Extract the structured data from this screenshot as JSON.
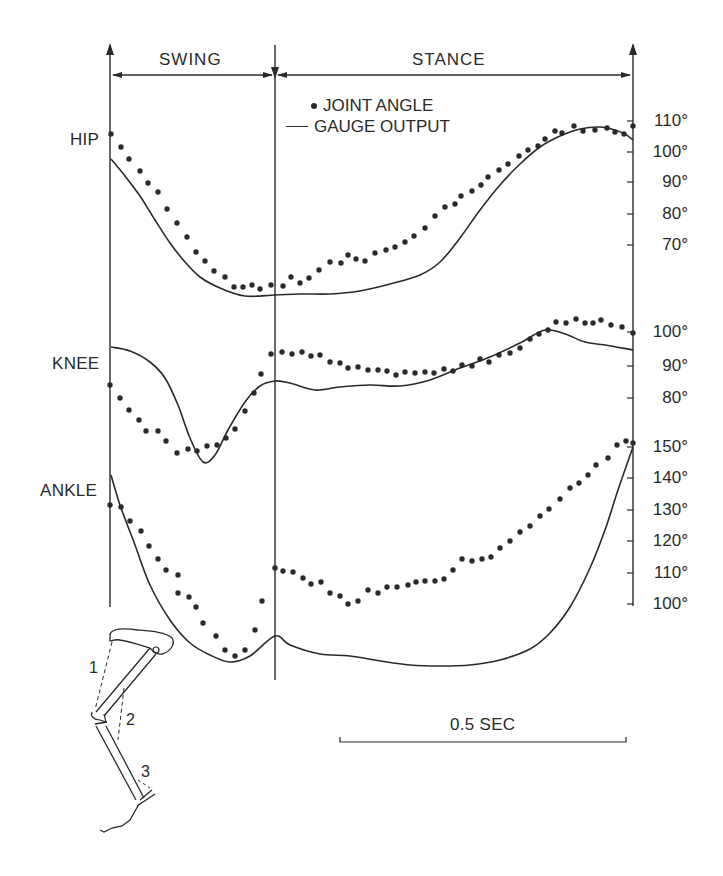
{
  "chart_data": {
    "type": "line",
    "title": "",
    "phases": [
      {
        "label": "SWING",
        "x_start_px": 110,
        "x_end_px": 275
      },
      {
        "label": "STANCE",
        "x_start_px": 275,
        "x_end_px": 633
      }
    ],
    "legend": [
      {
        "marker": "dot",
        "label": "JOINT ANGLE"
      },
      {
        "marker": "line",
        "label": "GAUGE OUTPUT"
      }
    ],
    "time_scale": {
      "label": "0.5 SEC",
      "x1_px": 340,
      "x2_px": 626,
      "y_px": 742
    },
    "panels": [
      {
        "name": "HIP",
        "unit": "degrees",
        "ticks": [
          {
            "label": "110°",
            "value": 110,
            "y_px": 121
          },
          {
            "label": "100°",
            "value": 100,
            "y_px": 152
          },
          {
            "label": "90°",
            "value": 90,
            "y_px": 182
          },
          {
            "label": "80°",
            "value": 80,
            "y_px": 214
          },
          {
            "label": "70°",
            "value": 70,
            "y_px": 245
          }
        ],
        "joint_angle_points_px": [
          [
            111,
            134
          ],
          [
            121,
            147
          ],
          [
            129,
            159
          ],
          [
            140,
            171
          ],
          [
            148,
            183
          ],
          [
            158,
            192
          ],
          [
            167,
            209
          ],
          [
            177,
            223
          ],
          [
            187,
            237
          ],
          [
            196,
            252
          ],
          [
            205,
            261
          ],
          [
            214,
            271
          ],
          [
            225,
            277
          ],
          [
            234,
            287
          ],
          [
            243,
            287
          ],
          [
            252,
            285
          ],
          [
            260,
            289
          ],
          [
            271,
            285
          ],
          [
            283,
            286
          ],
          [
            291,
            277
          ],
          [
            300,
            283
          ],
          [
            309,
            278
          ],
          [
            319,
            270
          ],
          [
            330,
            262
          ],
          [
            341,
            263
          ],
          [
            348,
            255
          ],
          [
            356,
            259
          ],
          [
            365,
            261
          ],
          [
            375,
            253
          ],
          [
            386,
            250
          ],
          [
            395,
            247
          ],
          [
            405,
            242
          ],
          [
            414,
            236
          ],
          [
            425,
            228
          ],
          [
            435,
            216
          ],
          [
            445,
            207
          ],
          [
            455,
            204
          ],
          [
            461,
            196
          ],
          [
            472,
            191
          ],
          [
            481,
            185
          ],
          [
            488,
            177
          ],
          [
            499,
            170
          ],
          [
            508,
            164
          ],
          [
            519,
            156
          ],
          [
            528,
            150
          ],
          [
            538,
            146
          ],
          [
            545,
            139
          ],
          [
            555,
            131
          ],
          [
            562,
            133
          ],
          [
            574,
            126
          ],
          [
            583,
            131
          ],
          [
            595,
            130
          ],
          [
            607,
            128
          ],
          [
            615,
            132
          ],
          [
            624,
            134
          ],
          [
            633,
            126
          ]
        ],
        "gauge_output_path_px": [
          [
            111,
            159
          ],
          [
            125,
            176
          ],
          [
            140,
            196
          ],
          [
            155,
            220
          ],
          [
            170,
            243
          ],
          [
            185,
            262
          ],
          [
            200,
            277
          ],
          [
            220,
            288
          ],
          [
            245,
            296
          ],
          [
            275,
            295
          ],
          [
            300,
            294
          ],
          [
            330,
            294
          ],
          [
            360,
            291
          ],
          [
            390,
            284
          ],
          [
            420,
            275
          ],
          [
            440,
            262
          ],
          [
            460,
            238
          ],
          [
            480,
            210
          ],
          [
            500,
            185
          ],
          [
            520,
            164
          ],
          [
            540,
            147
          ],
          [
            560,
            136
          ],
          [
            580,
            129
          ],
          [
            600,
            127
          ],
          [
            615,
            130
          ],
          [
            625,
            134
          ],
          [
            633,
            140
          ]
        ]
      },
      {
        "name": "KNEE",
        "unit": "degrees",
        "ticks": [
          {
            "label": "100°",
            "value": 100,
            "y_px": 332
          },
          {
            "label": "90°",
            "value": 90,
            "y_px": 366
          },
          {
            "label": "80°",
            "value": 80,
            "y_px": 398
          }
        ],
        "joint_angle_points_px": [
          [
            110,
            385
          ],
          [
            120,
            398
          ],
          [
            129,
            410
          ],
          [
            139,
            420
          ],
          [
            146,
            431
          ],
          [
            158,
            431
          ],
          [
            166,
            441
          ],
          [
            177,
            453
          ],
          [
            188,
            449
          ],
          [
            197,
            451
          ],
          [
            207,
            446
          ],
          [
            217,
            445
          ],
          [
            226,
            438
          ],
          [
            235,
            429
          ],
          [
            245,
            411
          ],
          [
            254,
            393
          ],
          [
            261,
            374
          ],
          [
            271,
            354
          ],
          [
            282,
            352
          ],
          [
            292,
            354
          ],
          [
            302,
            352
          ],
          [
            311,
            356
          ],
          [
            320,
            355
          ],
          [
            330,
            362
          ],
          [
            340,
            363
          ],
          [
            348,
            368
          ],
          [
            358,
            367
          ],
          [
            368,
            370
          ],
          [
            378,
            370
          ],
          [
            387,
            371
          ],
          [
            396,
            375
          ],
          [
            405,
            372
          ],
          [
            415,
            373
          ],
          [
            425,
            372
          ],
          [
            434,
            373
          ],
          [
            444,
            369
          ],
          [
            453,
            371
          ],
          [
            462,
            365
          ],
          [
            472,
            366
          ],
          [
            480,
            359
          ],
          [
            489,
            362
          ],
          [
            499,
            355
          ],
          [
            510,
            353
          ],
          [
            520,
            348
          ],
          [
            530,
            339
          ],
          [
            539,
            334
          ],
          [
            548,
            330
          ],
          [
            556,
            322
          ],
          [
            566,
            323
          ],
          [
            576,
            319
          ],
          [
            585,
            323
          ],
          [
            593,
            323
          ],
          [
            601,
            320
          ],
          [
            611,
            325
          ],
          [
            622,
            327
          ],
          [
            633,
            333
          ]
        ],
        "gauge_output_path_px": [
          [
            111,
            347
          ],
          [
            130,
            351
          ],
          [
            150,
            362
          ],
          [
            165,
            378
          ],
          [
            178,
            405
          ],
          [
            190,
            438
          ],
          [
            203,
            462
          ],
          [
            215,
            455
          ],
          [
            228,
            430
          ],
          [
            245,
            402
          ],
          [
            260,
            386
          ],
          [
            275,
            381
          ],
          [
            290,
            383
          ],
          [
            315,
            390
          ],
          [
            340,
            387
          ],
          [
            370,
            385
          ],
          [
            400,
            386
          ],
          [
            430,
            380
          ],
          [
            460,
            368
          ],
          [
            490,
            357
          ],
          [
            520,
            343
          ],
          [
            545,
            330
          ],
          [
            565,
            334
          ],
          [
            585,
            342
          ],
          [
            605,
            345
          ],
          [
            633,
            350
          ]
        ]
      },
      {
        "name": "ANKLE",
        "unit": "degrees",
        "ticks": [
          {
            "label": "150°",
            "value": 150,
            "y_px": 447
          },
          {
            "label": "140°",
            "value": 140,
            "y_px": 478
          },
          {
            "label": "130°",
            "value": 130,
            "y_px": 510
          },
          {
            "label": "120°",
            "value": 120,
            "y_px": 541
          },
          {
            "label": "110°",
            "value": 110,
            "y_px": 573
          },
          {
            "label": "100°",
            "value": 100,
            "y_px": 604
          }
        ],
        "joint_angle_points_px": [
          [
            110,
            505
          ],
          [
            121,
            507
          ],
          [
            130,
            521
          ],
          [
            141,
            531
          ],
          [
            149,
            546
          ],
          [
            158,
            559
          ],
          [
            166,
            570
          ],
          [
            178,
            575
          ],
          [
            178,
            593
          ],
          [
            189,
            597
          ],
          [
            196,
            607
          ],
          [
            203,
            623
          ],
          [
            216,
            636
          ],
          [
            225,
            650
          ],
          [
            235,
            656
          ],
          [
            245,
            650
          ],
          [
            255,
            630
          ],
          [
            262,
            601
          ],
          [
            275,
            568
          ],
          [
            283,
            571
          ],
          [
            293,
            572
          ],
          [
            303,
            578
          ],
          [
            311,
            584
          ],
          [
            321,
            582
          ],
          [
            330,
            593
          ],
          [
            340,
            596
          ],
          [
            348,
            604
          ],
          [
            358,
            601
          ],
          [
            368,
            590
          ],
          [
            378,
            593
          ],
          [
            387,
            587
          ],
          [
            397,
            587
          ],
          [
            408,
            585
          ],
          [
            416,
            582
          ],
          [
            425,
            581
          ],
          [
            435,
            581
          ],
          [
            444,
            579
          ],
          [
            453,
            570
          ],
          [
            462,
            559
          ],
          [
            472,
            561
          ],
          [
            482,
            559
          ],
          [
            491,
            557
          ],
          [
            500,
            548
          ],
          [
            510,
            541
          ],
          [
            520,
            532
          ],
          [
            530,
            526
          ],
          [
            540,
            516
          ],
          [
            549,
            509
          ],
          [
            560,
            499
          ],
          [
            570,
            488
          ],
          [
            579,
            483
          ],
          [
            588,
            475
          ],
          [
            596,
            465
          ],
          [
            608,
            458
          ],
          [
            617,
            445
          ],
          [
            626,
            441
          ],
          [
            633,
            443
          ]
        ],
        "gauge_output_path_px": [
          [
            111,
            475
          ],
          [
            120,
            505
          ],
          [
            135,
            545
          ],
          [
            150,
            585
          ],
          [
            170,
            620
          ],
          [
            190,
            643
          ],
          [
            210,
            655
          ],
          [
            230,
            662
          ],
          [
            250,
            656
          ],
          [
            275,
            636
          ],
          [
            290,
            645
          ],
          [
            320,
            654
          ],
          [
            350,
            656
          ],
          [
            380,
            661
          ],
          [
            410,
            665
          ],
          [
            440,
            666
          ],
          [
            470,
            665
          ],
          [
            500,
            660
          ],
          [
            530,
            649
          ],
          [
            550,
            633
          ],
          [
            570,
            607
          ],
          [
            590,
            568
          ],
          [
            605,
            530
          ],
          [
            618,
            490
          ],
          [
            633,
            447
          ]
        ]
      }
    ],
    "axes": {
      "left_x_px": 110,
      "mid_x_px": 275,
      "right_x_px": 633,
      "top_y_px": 45,
      "left_bottom_y_px": 607,
      "mid_bottom_y_px": 680,
      "right_bottom_y_px": 606
    },
    "inset": {
      "description": "leg skeleton drawing with gauge locations",
      "labels": [
        "1",
        "2",
        "3"
      ]
    }
  },
  "labels": {
    "swing": "SWING",
    "stance": "STANCE",
    "joint_angle": "JOINT ANGLE",
    "gauge_output": "GAUGE OUTPUT",
    "hip": "HIP",
    "knee": "KNEE",
    "ankle": "ANKLE",
    "scale": "0.5 SEC",
    "inset_1": "1",
    "inset_2": "2",
    "inset_3": "3"
  },
  "colors": {
    "ink": "#2a2a2a",
    "background": "#ffffff"
  }
}
